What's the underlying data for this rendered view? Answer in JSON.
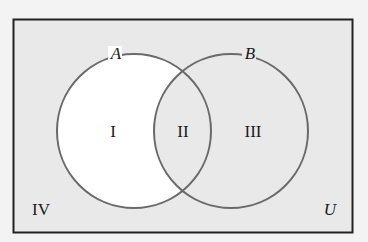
{
  "diagram": {
    "type": "venn",
    "universe_label": "U",
    "sets": [
      {
        "name": "A",
        "label": "A"
      },
      {
        "name": "B",
        "label": "B"
      }
    ],
    "regions": [
      {
        "id": "I",
        "label": "I",
        "description": "A only",
        "shaded": false
      },
      {
        "id": "II",
        "label": "II",
        "description": "A and B",
        "shaded": true
      },
      {
        "id": "III",
        "label": "III",
        "description": "B only",
        "shaded": true
      },
      {
        "id": "IV",
        "label": "IV",
        "description": "outside A and B",
        "shaded": true
      }
    ],
    "colors": {
      "background": "#f3f3f3",
      "shaded": "#e9e9e9",
      "unshaded": "#ffffff",
      "circle_stroke": "#6a6a6a",
      "border": "#222222"
    }
  }
}
